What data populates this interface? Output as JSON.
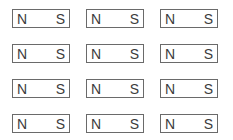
{
  "diagram": {
    "type": "bar-magnet-grid",
    "rows": 4,
    "columns": 3,
    "magnets": [
      [
        {
          "left": "N",
          "right": "S"
        },
        {
          "left": "N",
          "right": "S"
        },
        {
          "left": "N",
          "right": "S"
        }
      ],
      [
        {
          "left": "N",
          "right": "S"
        },
        {
          "left": "N",
          "right": "S"
        },
        {
          "left": "N",
          "right": "S"
        }
      ],
      [
        {
          "left": "N",
          "right": "S"
        },
        {
          "left": "N",
          "right": "S"
        },
        {
          "left": "N",
          "right": "S"
        }
      ],
      [
        {
          "left": "N",
          "right": "S"
        },
        {
          "left": "N",
          "right": "S"
        },
        {
          "left": "N",
          "right": "S"
        }
      ]
    ],
    "colors": {
      "border": "#6a6a6a",
      "text": "#3c3c3c",
      "background": "#ffffff"
    }
  }
}
